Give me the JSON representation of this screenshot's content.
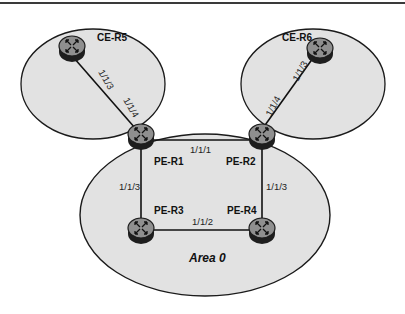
{
  "diagram": {
    "type": "network-topology",
    "colors": {
      "area_fill": "#e2e2e2",
      "area_stroke": "#1a1a1a",
      "router_body": "#8f8f8f",
      "router_side": "#1e1e1e",
      "link": "#111111",
      "border": "#3a3a3a"
    },
    "areas": [
      {
        "id": "ce-r5-area",
        "label": ""
      },
      {
        "id": "ce-r6-area",
        "label": ""
      },
      {
        "id": "area-0",
        "label": "Area 0"
      }
    ],
    "routers": [
      {
        "id": "CE-R5",
        "label": "CE-R5",
        "icon": "router-icon"
      },
      {
        "id": "CE-R6",
        "label": "CE-R6",
        "icon": "router-icon"
      },
      {
        "id": "PE-R1",
        "label": "PE-R1",
        "icon": "router-icon"
      },
      {
        "id": "PE-R2",
        "label": "PE-R2",
        "icon": "router-icon"
      },
      {
        "id": "PE-R3",
        "label": "PE-R3",
        "icon": "router-icon"
      },
      {
        "id": "PE-R4",
        "label": "PE-R4",
        "icon": "router-icon"
      }
    ],
    "links": [
      {
        "from": "CE-R5",
        "to": "PE-R1",
        "from_port": "1/1/3",
        "to_port": "1/1/4"
      },
      {
        "from": "CE-R6",
        "to": "PE-R2",
        "from_port": "1/1/3",
        "to_port": "1/1/4"
      },
      {
        "from": "PE-R1",
        "to": "PE-R2",
        "port": "1/1/1"
      },
      {
        "from": "PE-R1",
        "to": "PE-R3",
        "port": "1/1/3"
      },
      {
        "from": "PE-R2",
        "to": "PE-R4",
        "port": "1/1/3"
      },
      {
        "from": "PE-R3",
        "to": "PE-R4",
        "port": "1/1/2"
      }
    ]
  }
}
